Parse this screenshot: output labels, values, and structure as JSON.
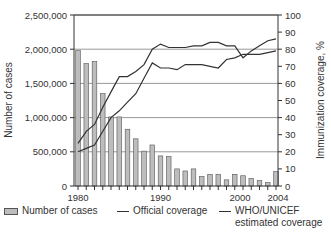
{
  "chart_data": {
    "type": "bar+line",
    "title": "",
    "xlabel": "",
    "ylabel_left": "Number of cases",
    "ylabel_right": "Immunization coverage, %",
    "ylim_left": [
      0,
      2500000
    ],
    "ylim_right": [
      0,
      100
    ],
    "grid": true,
    "legend_position": "bottom",
    "x": [
      1980,
      1981,
      1982,
      1983,
      1984,
      1985,
      1986,
      1987,
      1988,
      1989,
      1990,
      1991,
      1992,
      1993,
      1994,
      1995,
      1996,
      1997,
      1998,
      1999,
      2000,
      2001,
      2002,
      2003,
      2004
    ],
    "x_tick_labels": [
      "1980",
      "1990",
      "2000",
      "2004"
    ],
    "left_tick_labels": [
      "0",
      "500,000",
      "1,000,000",
      "1,500,000",
      "2,000,000",
      "2,500,000"
    ],
    "left_ticks": [
      0,
      500000,
      1000000,
      1500000,
      2000000,
      2500000
    ],
    "right_tick_labels": [
      "0",
      "10",
      "20",
      "30",
      "40",
      "50",
      "60",
      "70",
      "80",
      "90",
      "100"
    ],
    "right_ticks": [
      0,
      10,
      20,
      30,
      40,
      50,
      60,
      70,
      80,
      90,
      100
    ],
    "series": [
      {
        "name": "Number of cases",
        "type": "bar",
        "axis": "left",
        "values": [
          1980000,
          1790000,
          1820000,
          1350000,
          1010000,
          1010000,
          830000,
          690000,
          510000,
          600000,
          440000,
          430000,
          250000,
          220000,
          250000,
          140000,
          170000,
          170000,
          90000,
          170000,
          150000,
          110000,
          80000,
          50000,
          210000
        ]
      },
      {
        "name": "Official coverage",
        "type": "line",
        "axis": "right",
        "values": [
          25,
          32,
          36,
          46,
          55,
          64,
          64,
          67,
          71,
          80,
          83,
          81,
          81,
          81,
          82,
          82,
          84,
          84,
          82,
          82,
          75,
          79,
          82,
          85,
          86
        ]
      },
      {
        "name": "WHO/UNICEF estimated coverage",
        "type": "line",
        "axis": "right",
        "values": [
          20,
          22,
          24,
          32,
          40,
          44,
          49,
          54,
          63,
          72,
          69,
          69,
          68,
          71,
          71,
          71,
          70,
          69,
          74,
          75,
          77,
          77,
          77,
          78,
          79
        ]
      }
    ]
  },
  "legend": {
    "cases_label": "Number of cases",
    "official_label": "Official coverage",
    "who_label_line1": "WHO/UNICEF",
    "who_label_line2": "estimated coverage"
  },
  "colors": {
    "bar_fill": "#bdbdbd",
    "bar_stroke": "#555555",
    "line": "#333333",
    "grid": "#999999",
    "axis": "#333333"
  }
}
